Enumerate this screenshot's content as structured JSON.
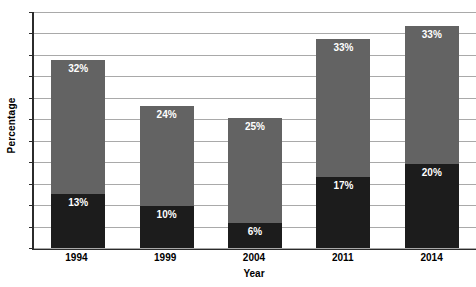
{
  "chart_data": {
    "type": "bar",
    "subtype": "stacked-bar",
    "title": "",
    "xlabel": "Year",
    "ylabel": "Percentage",
    "categories": [
      "1994",
      "1999",
      "2004",
      "2011",
      "2014"
    ],
    "series": [
      {
        "name": "bottom-segment",
        "color": "#1c1c1c",
        "values": [
          13,
          10,
          6,
          17,
          20
        ],
        "labels": [
          "13%",
          "10%",
          "6%",
          "17%",
          "20%"
        ]
      },
      {
        "name": "top-segment",
        "color": "#636363",
        "values": [
          32,
          24,
          25,
          33,
          33
        ],
        "labels": [
          "32%",
          "24%",
          "25%",
          "33%",
          "33%"
        ]
      }
    ],
    "totals": [
      45,
      34,
      31,
      50,
      53
    ],
    "ylim": [
      0,
      57
    ],
    "ytick_labels": [],
    "gridlines": {
      "axis": "y",
      "visible": true,
      "count": 12,
      "color": "#a9a9a9"
    },
    "legend": {
      "visible": false,
      "position": "none"
    },
    "axis_color": "#2b2b2b",
    "background": "#ffffff"
  }
}
